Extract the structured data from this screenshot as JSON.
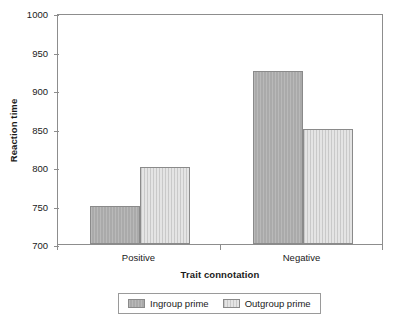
{
  "chart_data": {
    "type": "bar",
    "title": "",
    "xlabel": "Trait connotation",
    "ylabel": "Reaction time",
    "categories": [
      "Positive",
      "Negative"
    ],
    "series": [
      {
        "name": "Ingroup prime",
        "values": [
          750,
          925
        ],
        "color": "#aaaaaa"
      },
      {
        "name": "Outgroup prime",
        "values": [
          800,
          849
        ],
        "color": "#e4e4e4"
      }
    ],
    "ylim": [
      700,
      1000
    ],
    "yticks": [
      700,
      750,
      800,
      850,
      900,
      950,
      1000
    ],
    "ytick_labels": [
      "700",
      "750",
      "800",
      "850",
      "900",
      "950",
      "1000"
    ],
    "grid": false,
    "legend_position": "bottom-center",
    "frame": true
  },
  "axes": {
    "y_title": "Reaction time",
    "x_title": "Trait connotation"
  },
  "legend": {
    "entries": [
      {
        "label": "Ingroup prime",
        "swatch": "dark-gray-swatch-icon"
      },
      {
        "label": "Outgroup prime",
        "swatch": "light-gray-swatch-icon"
      }
    ]
  }
}
